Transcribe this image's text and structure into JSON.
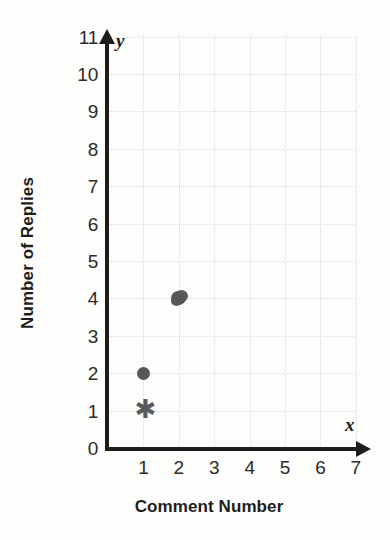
{
  "chart_data": {
    "type": "scatter",
    "title": "",
    "xlabel": "Comment Number",
    "ylabel": "Number of Replies",
    "x_axis_symbol": "x",
    "y_axis_symbol": "y",
    "xlim": [
      0,
      7
    ],
    "ylim": [
      0,
      11
    ],
    "grid": true,
    "legend": "none",
    "x_ticks": [
      "0",
      "1",
      "2",
      "3",
      "4",
      "5",
      "6",
      "7"
    ],
    "y_ticks": [
      "0",
      "1",
      "2",
      "3",
      "4",
      "5",
      "6",
      "7",
      "8",
      "9",
      "10",
      "11"
    ],
    "points": [
      {
        "x": 1,
        "y": 1,
        "marker": "asterisk",
        "color": "#5a5a5e",
        "glyph": "✱"
      },
      {
        "x": 1,
        "y": 2,
        "marker": "circle",
        "color": "#56565a",
        "glyph": ""
      },
      {
        "x": 2,
        "y": 4,
        "marker": "circle-blob",
        "color": "#56565a",
        "glyph": ""
      }
    ],
    "colors": {
      "axis": "#1d1d1b",
      "grid": "#dcdcd8",
      "marker": "#56565a",
      "background": "#fdfdfc",
      "tick_text": "#2b2b29"
    }
  }
}
